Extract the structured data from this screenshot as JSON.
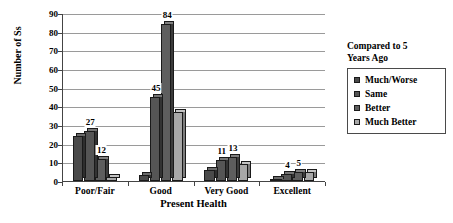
{
  "chart_data": {
    "type": "bar",
    "title": "",
    "xlabel": "Present Health",
    "ylabel": "Number of Ss",
    "ylim": [
      0,
      90
    ],
    "ystep": 10,
    "ytick_labels": [
      "0",
      "10",
      "20",
      "30",
      "40",
      "50",
      "60",
      "70",
      "80",
      "90"
    ],
    "grid": true,
    "legend_position": "right",
    "legend_title": "Compared to 5 Years Ago",
    "legend_title_lines": [
      "Compared to 5",
      "Years Ago"
    ],
    "categories": [
      "Poor/Fair",
      "Good",
      "Very Good",
      "Excellent"
    ],
    "series": [
      {
        "name": "Much/Worse",
        "color": "#4a4a4a",
        "side_color": "#2e2e2e",
        "top_color": "#6b6b6b",
        "values": [
          24,
          3,
          6,
          1
        ],
        "labels": [
          "",
          "",
          "",
          ""
        ]
      },
      {
        "name": "Same",
        "color": "#555555",
        "side_color": "#333333",
        "top_color": "#757575",
        "values": [
          27,
          45,
          11,
          4
        ],
        "labels": [
          "27",
          "45",
          "11",
          "4"
        ]
      },
      {
        "name": "Better",
        "color": "#5e5e5e",
        "side_color": "#3b3b3b",
        "top_color": "#808080",
        "values": [
          12,
          84,
          13,
          5
        ],
        "labels": [
          "12",
          "84",
          "13",
          "5"
        ]
      },
      {
        "name": "Much Better",
        "color": "#a8a8a8",
        "side_color": "#7d7d7d",
        "top_color": "#c4c4c4",
        "values": [
          2,
          37,
          9,
          5
        ],
        "labels": [
          "",
          "",
          "",
          ""
        ]
      }
    ]
  }
}
